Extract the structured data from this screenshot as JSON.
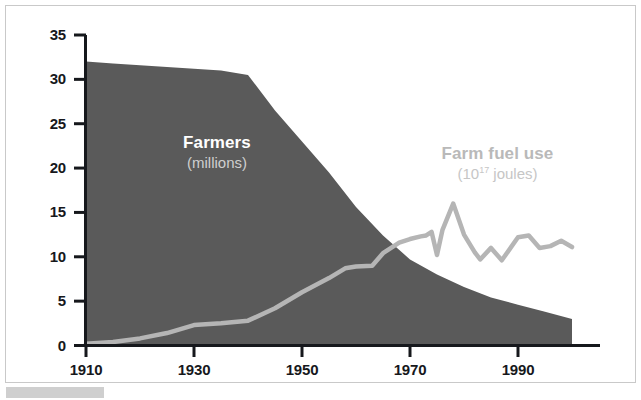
{
  "chart_data": {
    "type": "area",
    "title": "",
    "subtitle": "",
    "xlabel": "",
    "ylabel": "",
    "xlim": [
      1910,
      2000
    ],
    "ylim": [
      0,
      35
    ],
    "grid": false,
    "legend_position": "inline-annotations",
    "x_ticks": [
      "1910",
      "1930",
      "1950",
      "1970",
      "1990"
    ],
    "x_tick_values": [
      1910,
      1930,
      1950,
      1970,
      1990
    ],
    "y_ticks": [
      "0",
      "5",
      "10",
      "15",
      "20",
      "25",
      "30",
      "35"
    ],
    "y_tick_values": [
      0,
      5,
      10,
      15,
      20,
      25,
      30,
      35
    ],
    "series": [
      {
        "name": "Farmers",
        "units": "millions",
        "label_main": "Farmers",
        "label_sub": "(millions)",
        "render": "area",
        "color": "#5a5a5a",
        "x": [
          1910,
          1915,
          1920,
          1925,
          1930,
          1935,
          1940,
          1945,
          1950,
          1955,
          1960,
          1965,
          1970,
          1975,
          1980,
          1985,
          1990,
          1995,
          2000
        ],
        "values": [
          32.0,
          31.8,
          31.6,
          31.4,
          31.2,
          31.0,
          30.5,
          26.5,
          23.0,
          19.5,
          15.6,
          12.4,
          9.7,
          8.0,
          6.6,
          5.4,
          4.6,
          3.8,
          3.0
        ]
      },
      {
        "name": "Farm fuel use",
        "units": "10^17 joules",
        "label_main": "Farm fuel use",
        "label_sub_prefix": "(10",
        "label_sub_exponent": "17",
        "label_sub_suffix": " joules)",
        "render": "line",
        "color": "#b5b5b5",
        "x": [
          1910,
          1915,
          1920,
          1925,
          1930,
          1935,
          1940,
          1945,
          1950,
          1955,
          1958,
          1960,
          1963,
          1965,
          1968,
          1970,
          1972,
          1973,
          1974,
          1975,
          1976,
          1978,
          1980,
          1982,
          1983,
          1985,
          1987,
          1990,
          1992,
          1994,
          1996,
          1998,
          2000
        ],
        "values": [
          0.2,
          0.4,
          0.8,
          1.4,
          2.3,
          2.5,
          2.8,
          4.2,
          6.0,
          7.6,
          8.7,
          8.9,
          9.0,
          10.4,
          11.6,
          12.0,
          12.3,
          12.4,
          12.8,
          10.2,
          13.0,
          16.0,
          12.5,
          10.5,
          9.7,
          11.0,
          9.6,
          12.2,
          12.4,
          11.0,
          11.2,
          11.8,
          11.1
        ]
      }
    ]
  },
  "axes": {
    "axis_color": "#16181c",
    "background": "#ffffff"
  },
  "frame": {
    "border_color": "#c9c9c9",
    "footer_bar_color": "#cfcfcf"
  }
}
